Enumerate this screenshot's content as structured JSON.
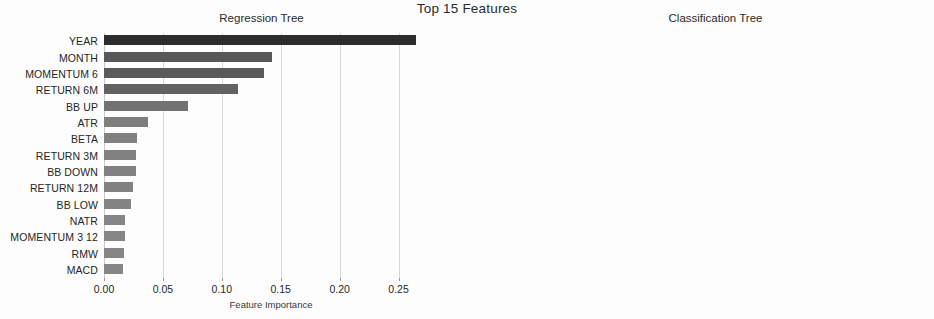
{
  "figure": {
    "suptitle": "Top 15 Features",
    "background_color": "#ffffff",
    "bar_color": "#2c2c2c",
    "grid_color": "#d8d8d8"
  },
  "chart_data": [
    {
      "type": "bar",
      "orientation": "horizontal",
      "title": "Regression Tree",
      "xlabel": "Feature Importance",
      "ylabel": "",
      "xlim": [
        0,
        0.2835
      ],
      "xticks": [
        0.0,
        0.05,
        0.1,
        0.15,
        0.2,
        0.25
      ],
      "xticklabels": [
        "0.00",
        "0.05",
        "0.10",
        "0.15",
        "0.20",
        "0.25"
      ],
      "grid": true,
      "legend": "none",
      "categories": [
        "YEAR",
        "MONTH",
        "MOMENTUM 6",
        "RETURN 6M",
        "BB UP",
        "ATR",
        "BETA",
        "RETURN 3M",
        "BB DOWN",
        "RETURN 12M",
        "BB LOW",
        "NATR",
        "MOMENTUM 3 12",
        "RMW",
        "MACD"
      ],
      "values": [
        0.265,
        0.143,
        0.136,
        0.114,
        0.071,
        0.037,
        0.028,
        0.027,
        0.027,
        0.025,
        0.023,
        0.018,
        0.018,
        0.017,
        0.016
      ]
    },
    {
      "type": "bar",
      "orientation": "horizontal",
      "title": "Classification Tree",
      "xlabel": "Feature Importance",
      "ylabel": "",
      "xlim": [
        0,
        0.2835
      ],
      "xticks": [
        0.0,
        0.05,
        0.1,
        0.15,
        0.2,
        0.25
      ],
      "xticklabels": [
        "0.00",
        "0.05",
        "0.10",
        "0.15",
        "0.20",
        "0.25"
      ],
      "grid": true,
      "legend": "none",
      "categories": [
        "MONTH",
        "YEAR",
        "BB DOWN",
        "NATR",
        "RETURN 12M",
        "MOMENTUM 6",
        "MACD",
        "ATR",
        "MOMENTUM 3 6",
        "RSI",
        "RETURN 3M",
        "BB UP",
        "BB LOW",
        "MOMENTUM 3",
        "RETURN 6M"
      ],
      "values": [
        0.151,
        0.103,
        0.054,
        0.05,
        0.044,
        0.04,
        0.04,
        0.039,
        0.033,
        0.032,
        0.032,
        0.029,
        0.027,
        0.027,
        0.026
      ]
    }
  ]
}
